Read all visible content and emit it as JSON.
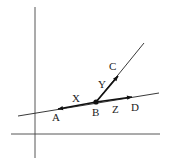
{
  "diagram": {
    "type": "geometry",
    "axes": {
      "vertical": {
        "x": 35,
        "y1": 7,
        "y2": 158
      },
      "horizontal": {
        "y": 134,
        "x1": 11,
        "x2": 160
      }
    },
    "points": [
      {
        "id": "A",
        "label": "A",
        "x": 58,
        "y": 109,
        "label_x": 52,
        "label_y": 121
      },
      {
        "id": "B",
        "label": "B",
        "x": 96,
        "y": 102,
        "label_x": 92,
        "label_y": 116
      },
      {
        "id": "C",
        "label": "C",
        "x": 118,
        "y": 76,
        "label_x": 109,
        "label_y": 70
      },
      {
        "id": "D",
        "label": "D",
        "x": 132,
        "y": 97,
        "label_x": 131,
        "label_y": 111
      }
    ],
    "segment_labels": [
      {
        "id": "X",
        "label": "X",
        "x": 72,
        "y": 102
      },
      {
        "id": "Y",
        "label": "Y",
        "x": 98,
        "y": 88
      },
      {
        "id": "Z",
        "label": "Z",
        "x": 112,
        "y": 113
      }
    ],
    "lines": [
      {
        "id": "line-AD",
        "x1": 18,
        "y1": 116,
        "x2": 159,
        "y2": 93
      },
      {
        "id": "ray-BC",
        "x1": 96,
        "y1": 102,
        "x2": 144,
        "y2": 43
      }
    ],
    "color": "#222222"
  }
}
